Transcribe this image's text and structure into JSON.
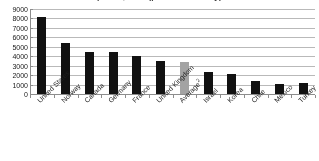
{
  "chart_data": {
    "type": "bar",
    "title": "prices, USD (per resident-day)",
    "subtitle": "",
    "xlabel": "",
    "ylabel": "",
    "ylim": [
      0,
      9000
    ],
    "ytick_step": 1000,
    "ytick_labels": [
      "9000",
      "8000",
      "7000",
      "6000",
      "5000",
      "4000",
      "3000",
      "2000",
      "1000",
      "0"
    ],
    "grid": true,
    "legend": false,
    "legend_position": "none",
    "categories": [
      "United States",
      "Norway",
      "Canada",
      "Germany",
      "France",
      "United Kingdom",
      "Average",
      "Israel",
      "Korea",
      "Chile",
      "Mexico",
      "Turkey"
    ],
    "category_superscripts": [
      "",
      "",
      "",
      "",
      "",
      "",
      "2",
      "",
      "",
      "",
      "",
      ""
    ],
    "values": [
      8200,
      5400,
      4500,
      4400,
      4050,
      3500,
      3400,
      2300,
      2150,
      1400,
      1100,
      1150
    ],
    "bar_colors": [
      "#111111",
      "#111111",
      "#111111",
      "#111111",
      "#111111",
      "#111111",
      "#a3a3a3",
      "#111111",
      "#111111",
      "#111111",
      "#111111",
      "#111111"
    ],
    "highlight_index": 6
  },
  "colors": {
    "bar": "#111111",
    "bar_highlight": "#a3a3a3",
    "gridline": "#b9b9b9",
    "axis": "#8d8d8d",
    "text": "#1f1f1f",
    "background": "#ffffff"
  }
}
